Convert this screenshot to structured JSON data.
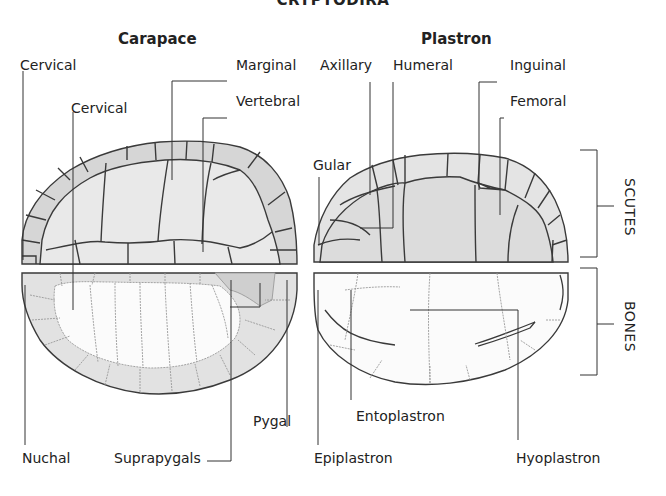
{
  "title": "CRYPTODIRA",
  "headings": {
    "carapace": "Carapace",
    "plastron": "Plastron"
  },
  "carapace_labels": {
    "cervical_top": "Cervical",
    "cervical_inner": "Cervical",
    "marginal": "Marginal",
    "vertebral": "Vertebral",
    "nuchal": "Nuchal",
    "suprapygals": "Suprapygals",
    "pygal": "Pygal"
  },
  "plastron_labels": {
    "axillary": "Axillary",
    "humeral": "Humeral",
    "inguinal": "Inguinal",
    "femoral": "Femoral",
    "gular": "Gular",
    "entoplastron": "Entoplastron",
    "epiplastron": "Epiplastron",
    "hyoplastron": "Hyoplastron"
  },
  "brackets": {
    "scutes": "SCUTES",
    "bones": "BONES"
  },
  "colors": {
    "marginal_fill": "#d6d6d6",
    "scute_fill": "#e9e9e9",
    "bone_inner_fill": "#fbfbfb",
    "bone_peripheral_fill": "#e2e2e2",
    "pygal_fill": "#cfcfcf",
    "outline": "#3a3a3a",
    "suture": "#9a9a9a",
    "leader": "#333333"
  }
}
